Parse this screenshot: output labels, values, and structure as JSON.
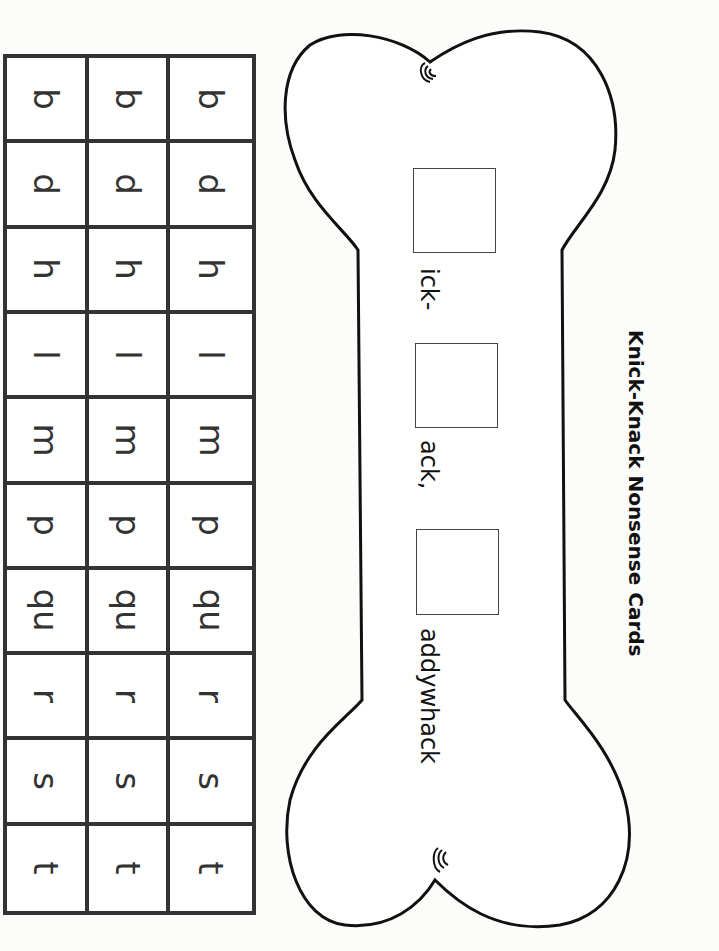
{
  "title": "Knick-Knack Nonsense Cards",
  "phrase": {
    "segments": [
      "ick-",
      "ack,",
      "addywhack"
    ],
    "blank_boxes": 3
  },
  "letter_cards": {
    "columns": 3,
    "rows": [
      {
        "letter": "b"
      },
      {
        "letter": "d"
      },
      {
        "letter": "h"
      },
      {
        "letter": "l"
      },
      {
        "letter": "m"
      },
      {
        "letter": "p"
      },
      {
        "letter": "qu"
      },
      {
        "letter": "r"
      },
      {
        "letter": "s"
      },
      {
        "letter": "t"
      }
    ],
    "cells": [
      [
        "b",
        "b",
        "b"
      ],
      [
        "d",
        "d",
        "d"
      ],
      [
        "h",
        "h",
        "h"
      ],
      [
        "l",
        "l",
        "l"
      ],
      [
        "m",
        "m",
        "m"
      ],
      [
        "p",
        "p",
        "p"
      ],
      [
        "qu",
        "qu",
        "qu"
      ],
      [
        "r",
        "r",
        "r"
      ],
      [
        "s",
        "s",
        "s"
      ],
      [
        "t",
        "t",
        "t"
      ]
    ]
  },
  "colors": {
    "line": "#333333",
    "outline": "#111111",
    "paper": "#fcfcfb"
  }
}
